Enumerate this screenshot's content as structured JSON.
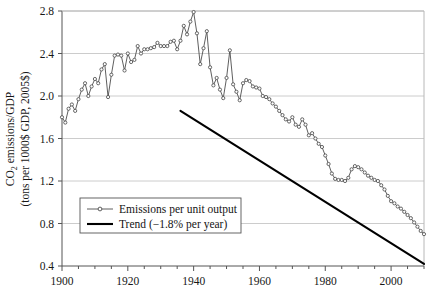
{
  "chart_data": {
    "type": "line",
    "title": "",
    "subtitle": "",
    "xlabel": "",
    "ylabel": "CO2 emissions/GDP (tons per 1000$ GDP, 2005$)",
    "ylabel_line1_prefix": "CO",
    "ylabel_line1_sub": "2",
    "ylabel_line1_suffix": " emissions/GDP",
    "ylabel_line2": "(tons per 1000$ GDP, 2005$)",
    "xlim": [
      1900,
      2010
    ],
    "ylim": [
      0.4,
      2.8
    ],
    "xticks_major": [
      1900,
      1920,
      1940,
      1960,
      1980,
      2000
    ],
    "xticks_major_labels": [
      "1900",
      "1920",
      "1940",
      "1960",
      "1980",
      "2000"
    ],
    "xticks_minor_step": 5,
    "yticks": [
      0.4,
      0.8,
      1.2,
      1.6,
      2.0,
      2.4,
      2.8
    ],
    "ytick_labels": [
      "0.4",
      "0.8",
      "1.2",
      "1.6",
      "2.0",
      "2.4",
      "2.8"
    ],
    "grid": "horizontal",
    "legend_position": "lower-left",
    "series": [
      {
        "name": "Emissions per unit output",
        "style": "line-with-markers",
        "color": "#4d4d4d",
        "marker": "open-circle",
        "x": [
          1900,
          1901,
          1902,
          1903,
          1904,
          1905,
          1906,
          1907,
          1908,
          1909,
          1910,
          1911,
          1912,
          1913,
          1914,
          1915,
          1916,
          1917,
          1918,
          1919,
          1920,
          1921,
          1922,
          1923,
          1924,
          1925,
          1926,
          1927,
          1928,
          1929,
          1930,
          1931,
          1932,
          1933,
          1934,
          1935,
          1936,
          1937,
          1938,
          1939,
          1940,
          1941,
          1942,
          1943,
          1944,
          1945,
          1946,
          1947,
          1948,
          1949,
          1950,
          1951,
          1952,
          1953,
          1954,
          1955,
          1956,
          1957,
          1958,
          1959,
          1960,
          1961,
          1962,
          1963,
          1964,
          1965,
          1966,
          1967,
          1968,
          1969,
          1970,
          1971,
          1972,
          1973,
          1974,
          1975,
          1976,
          1977,
          1978,
          1979,
          1980,
          1981,
          1982,
          1983,
          1984,
          1985,
          1986,
          1987,
          1988,
          1989,
          1990,
          1991,
          1992,
          1993,
          1994,
          1995,
          1996,
          1997,
          1998,
          1999,
          2000,
          2001,
          2002,
          2003,
          2004,
          2005,
          2006,
          2007,
          2008,
          2009,
          2010
        ],
        "y": [
          1.8,
          1.75,
          1.88,
          1.92,
          1.86,
          1.97,
          2.06,
          2.12,
          2.0,
          2.09,
          2.16,
          2.12,
          2.25,
          2.3,
          1.99,
          2.2,
          2.38,
          2.39,
          2.38,
          2.24,
          2.4,
          2.32,
          2.34,
          2.47,
          2.4,
          2.44,
          2.44,
          2.45,
          2.46,
          2.5,
          2.47,
          2.47,
          2.47,
          2.51,
          2.52,
          2.44,
          2.52,
          2.66,
          2.58,
          2.7,
          2.79,
          2.59,
          2.3,
          2.45,
          2.61,
          2.27,
          2.1,
          2.17,
          2.06,
          1.98,
          2.17,
          2.43,
          2.11,
          2.04,
          1.96,
          2.12,
          2.15,
          2.14,
          2.09,
          2.08,
          2.07,
          2.0,
          1.99,
          1.97,
          1.93,
          1.9,
          1.86,
          1.82,
          1.78,
          1.76,
          1.8,
          1.73,
          1.71,
          1.78,
          1.73,
          1.63,
          1.65,
          1.6,
          1.55,
          1.52,
          1.44,
          1.36,
          1.27,
          1.22,
          1.21,
          1.21,
          1.2,
          1.23,
          1.31,
          1.34,
          1.33,
          1.31,
          1.28,
          1.25,
          1.23,
          1.21,
          1.2,
          1.16,
          1.12,
          1.06,
          1.01,
          0.99,
          0.96,
          0.94,
          0.91,
          0.88,
          0.85,
          0.81,
          0.77,
          0.73,
          0.7
        ]
      },
      {
        "name": "Trend (-1.8% per year)",
        "style": "line",
        "color": "#000000",
        "x": [
          1936,
          2010
        ],
        "y": [
          1.86,
          0.42
        ]
      }
    ],
    "legend_entries": [
      {
        "label": "Emissions per unit output",
        "marker": "open-circle-line",
        "color": "#4d4d4d"
      },
      {
        "label": "Trend (−1.8% per year)",
        "marker": "thick-line",
        "color": "#000000"
      }
    ],
    "annotations": []
  },
  "colors": {
    "series_line": "#4d4d4d",
    "trend_line": "#000000",
    "grid": "#bfbfbf",
    "axis": "#555555",
    "background": "#ffffff",
    "text": "#171717"
  }
}
